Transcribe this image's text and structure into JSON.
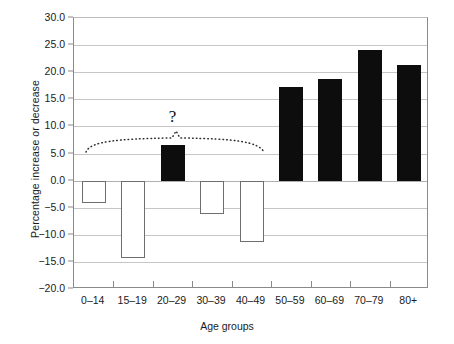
{
  "chart_data": {
    "type": "bar",
    "title": "",
    "xlabel": "Age groups",
    "ylabel": "Percentage increase or decrease",
    "categories": [
      "0–14",
      "15–19",
      "20–29",
      "30–39",
      "40–49",
      "50–59",
      "60–69",
      "70–79",
      "80+"
    ],
    "values": [
      -4.2,
      -14.3,
      6.5,
      -6.1,
      -11.3,
      17.3,
      18.8,
      24.1,
      21.4
    ],
    "bar_styles": [
      "hollow",
      "hollow",
      "filled",
      "hollow",
      "hollow",
      "filled",
      "filled",
      "filled",
      "filled"
    ],
    "ylim": [
      -20.0,
      30.0
    ],
    "ytick_labels": [
      "30.0",
      "25.0",
      "20.0",
      "15.0",
      "10.0",
      "5.0",
      "0.0",
      "−5.0",
      "−10.0",
      "−15.0",
      "−20.0"
    ],
    "ytick_values": [
      30,
      25,
      20,
      15,
      10,
      5,
      0,
      -5,
      -10,
      -15,
      -20
    ],
    "grid": true,
    "legend": "none",
    "annotations": [
      {
        "text": "?",
        "x_category": "20–29",
        "y_value": 11.5
      },
      {
        "text": "",
        "type": "dotted-brace",
        "from_category": "0–14",
        "to_category": "50–59",
        "y_value": 7.7
      }
    ],
    "colors": {
      "filled_bar": "#0d0d0d",
      "hollow_bar_fill": "#ffffff",
      "hollow_bar_border": "#6e6e6e",
      "gridline": "#c6c6c6",
      "axis": "#8a8a8a",
      "text": "#1a1a1a",
      "background": "#ffffff"
    }
  }
}
